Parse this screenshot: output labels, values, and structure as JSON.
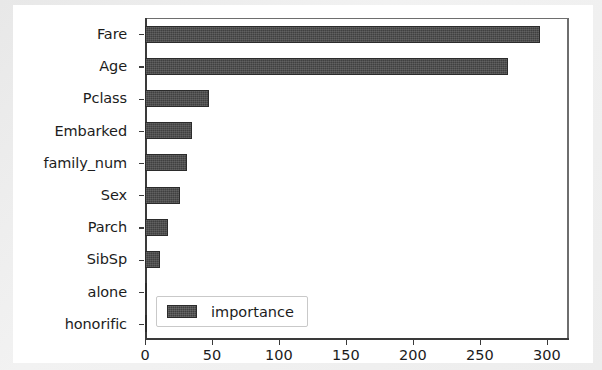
{
  "chart_data": {
    "type": "bar",
    "orientation": "horizontal",
    "title": "",
    "xlabel": "",
    "ylabel": "",
    "categories": [
      "Fare",
      "Age",
      "Pclass",
      "Embarked",
      "family_num",
      "Sex",
      "Parch",
      "SibSp",
      "alone",
      "honorific"
    ],
    "values": [
      295,
      271,
      48,
      35,
      31,
      26,
      17,
      11,
      1,
      0
    ],
    "series": [
      {
        "name": "importance",
        "values": [
          295,
          271,
          48,
          35,
          31,
          26,
          17,
          11,
          1,
          0
        ]
      }
    ],
    "xlim": [
      0,
      315
    ],
    "ylim_categories_top_to_bottom": [
      "Fare",
      "Age",
      "Pclass",
      "Embarked",
      "family_num",
      "Sex",
      "Parch",
      "SibSp",
      "alone",
      "honorific"
    ],
    "xticks": [
      0,
      50,
      100,
      150,
      200,
      250,
      300
    ],
    "xtick_labels": [
      "0",
      "50",
      "100",
      "150",
      "200",
      "250",
      "300"
    ],
    "ytick_labels": [
      "Fare",
      "Age",
      "Pclass",
      "Embarked",
      "family_num",
      "Sex",
      "Parch",
      "SibSp",
      "alone",
      "honorific"
    ],
    "grid": false,
    "legend": {
      "position": "lower left",
      "entries": [
        "importance"
      ]
    },
    "colors": {
      "bar": "#404040",
      "bar_edge": "#2b2b2b",
      "axis": "#3a3a3a",
      "text": "#1c1c1c",
      "plot_background": "#ffffff",
      "figure_background": "#ededed"
    }
  },
  "legend": {
    "label": "importance"
  }
}
